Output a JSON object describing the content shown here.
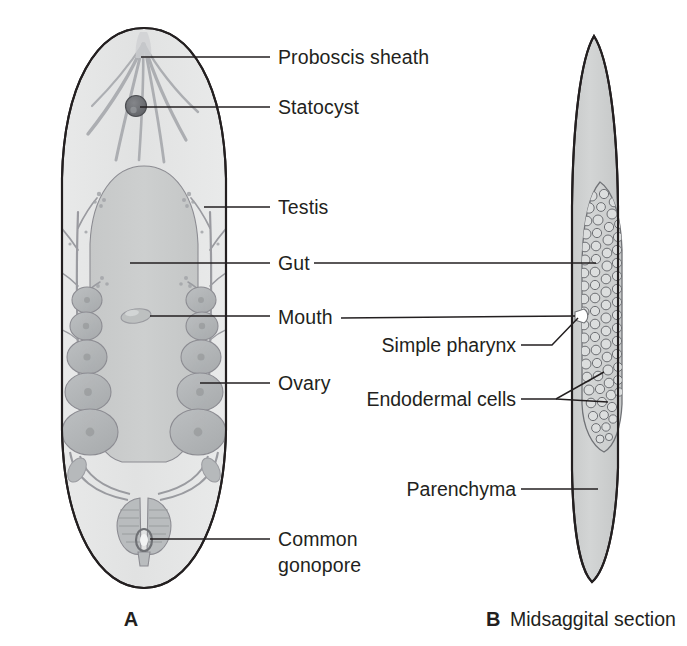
{
  "figure": {
    "background_color": "#ffffff",
    "text_color": "#231f20",
    "panels": [
      {
        "id": "A",
        "letter": "A",
        "caption": "",
        "view": "whole body, dorsal"
      },
      {
        "id": "B",
        "letter": "B",
        "caption": "Midsaggital section",
        "view": "midsaggital section"
      }
    ]
  },
  "labels": {
    "proboscis_sheath": "Proboscis sheath",
    "statocyst": "Statocyst",
    "testis": "Testis",
    "gut": "Gut",
    "mouth": "Mouth",
    "ovary": "Ovary",
    "common_gonopore_line1": "Common",
    "common_gonopore_line2": "gonopore",
    "simple_pharynx": "Simple pharynx",
    "endodermal_cells": "Endodermal cells",
    "parenchyma": "Parenchyma"
  },
  "label_list": [
    {
      "key": "proboscis_sheath",
      "text": "Proboscis sheath",
      "panel": "A",
      "align": "left",
      "x": 278,
      "y": 64,
      "leader_y": 57
    },
    {
      "key": "statocyst",
      "text": "Statocyst",
      "panel": "A",
      "align": "left",
      "x": 278,
      "y": 114,
      "leader_y": 107
    },
    {
      "key": "testis",
      "text": "Testis",
      "panel": "A",
      "align": "left",
      "x": 278,
      "y": 214,
      "leader_y": 207
    },
    {
      "key": "gut",
      "text": "Gut",
      "panel": "A",
      "align": "left",
      "x": 278,
      "y": 270,
      "leader_y": 263
    },
    {
      "key": "mouth",
      "text": "Mouth",
      "panel": "A",
      "align": "left",
      "x": 278,
      "y": 323,
      "leader_y": 316
    },
    {
      "key": "ovary",
      "text": "Ovary",
      "panel": "A",
      "align": "left",
      "x": 278,
      "y": 390,
      "leader_y": 383
    },
    {
      "key": "common_gonopore",
      "text": "Common gonopore",
      "panel": "A",
      "align": "left",
      "x": 278,
      "y": 546,
      "leader_y": 539
    },
    {
      "key": "simple_pharynx",
      "text": "Simple pharynx",
      "panel": "B",
      "align": "right",
      "x": 516,
      "y": 352,
      "leader_y": 345
    },
    {
      "key": "endodermal_cells",
      "text": "Endodermal cells",
      "panel": "B",
      "align": "right",
      "x": 516,
      "y": 406,
      "leader_y": 399
    },
    {
      "key": "parenchyma",
      "text": "Parenchyma",
      "panel": "B",
      "align": "right",
      "x": 516,
      "y": 496,
      "leader_y": 489
    }
  ],
  "colors": {
    "outline": "#231f20",
    "body_fill": "#e3e4e3",
    "body_fill_light": "#eceded",
    "gut_fill": "#c9cbcb",
    "ovary_fill": "#b3b6b8",
    "ovary_stroke": "#8c8c92",
    "testis_stroke": "#9a9ba0",
    "statocyst_fill": "#6f7175",
    "parenchyma_fill": "#cfd1d1",
    "endoderm_fill": "#d2d4d4",
    "cell_stroke": "#707276",
    "leader": "#231f20",
    "text": "#231f20"
  },
  "panel_captions": {
    "a_letter": "A",
    "b_letter": "B",
    "b_text": "Midsaggital section"
  }
}
